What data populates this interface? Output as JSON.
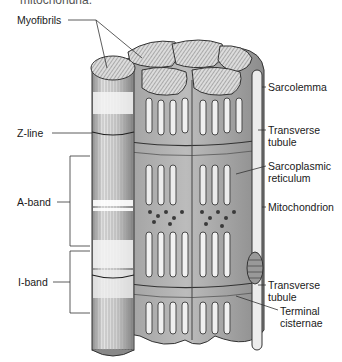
{
  "caption_fragment": "mitochondria.",
  "diagram": {
    "labels_left": [
      {
        "id": "myofibrils",
        "text": "Myofibrils"
      },
      {
        "id": "z_line",
        "text": "Z-line"
      },
      {
        "id": "a_band",
        "text": "A-band"
      },
      {
        "id": "i_band",
        "text": "I-band"
      }
    ],
    "labels_right": [
      {
        "id": "sarcolemma",
        "text": "Sarcolemma"
      },
      {
        "id": "transverse_tubule_1",
        "line1": "Transverse",
        "line2": "tubule"
      },
      {
        "id": "sarcoplasmic_reticulum",
        "line1": "Sarcoplasmic",
        "line2": "reticulum"
      },
      {
        "id": "mitochondrion",
        "text": "Mitochondrion"
      },
      {
        "id": "transverse_tubule_2",
        "line1": "Transverse",
        "line2": "tubule"
      },
      {
        "id": "terminal_cisternae",
        "line1": "Terminal",
        "line2": "cisternae"
      }
    ]
  },
  "colors": {
    "line": "#333333",
    "fiber_light": "#e8e8e8",
    "fiber_mid": "#bdbdbd",
    "fiber_dark": "#6b6b6b"
  }
}
